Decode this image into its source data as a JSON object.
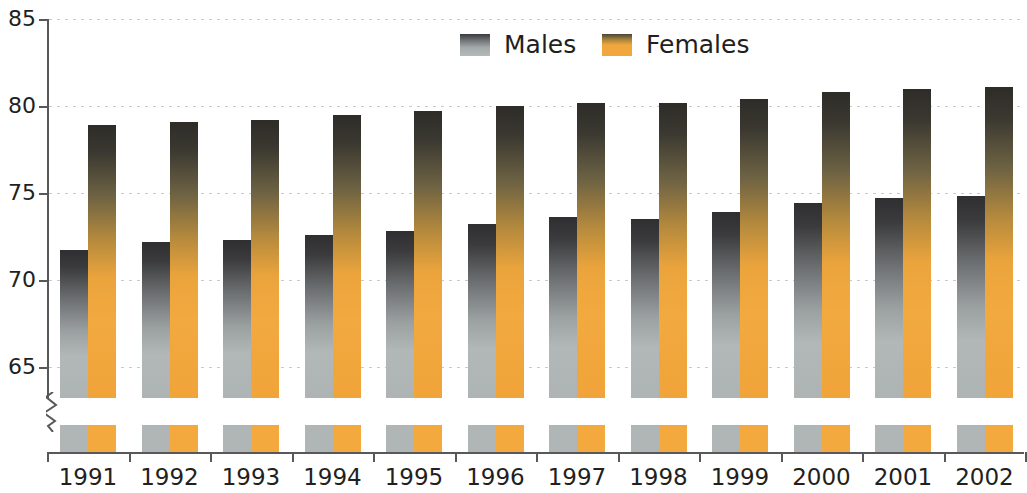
{
  "chart_data": {
    "type": "bar",
    "title": "",
    "subtitle": "",
    "xlabel": "",
    "ylabel": "",
    "categories": [
      "1991",
      "1992",
      "1993",
      "1994",
      "1995",
      "1996",
      "1997",
      "1998",
      "1999",
      "2000",
      "2001",
      "2002"
    ],
    "series": [
      {
        "name": "Males",
        "color": "#b0b5b6",
        "values": [
          71.7,
          72.2,
          72.3,
          72.6,
          72.8,
          73.2,
          73.6,
          73.5,
          73.9,
          74.4,
          74.7,
          74.8
        ]
      },
      {
        "name": "Females",
        "color": "#f3a93e",
        "values": [
          78.9,
          79.1,
          79.2,
          79.5,
          79.7,
          80.0,
          80.2,
          80.2,
          80.4,
          80.8,
          81.0,
          81.1
        ]
      }
    ],
    "ylim": [
      63.0,
      85.0
    ],
    "yticks": [
      65,
      70,
      75,
      80,
      85
    ],
    "ytick_labels": [
      "65",
      "70",
      "75",
      "80",
      "85"
    ],
    "grid": true,
    "grid_style": "dotted-horizontal",
    "axis_break": true,
    "axis_break_note": "y-axis is truncated; zigzag break symbol below 63 with bar stubs at baseline",
    "legend_position": "top-center",
    "legend": [
      "Males",
      "Females"
    ]
  },
  "legend": {
    "items": [
      {
        "label": "Males"
      },
      {
        "label": "Females"
      }
    ]
  },
  "axis": {
    "y_labels": [
      "85",
      "80",
      "75",
      "70",
      "65"
    ],
    "x_labels": [
      "1991",
      "1992",
      "1993",
      "1994",
      "1995",
      "1996",
      "1997",
      "1998",
      "1999",
      "2000",
      "2001",
      "2002"
    ]
  }
}
